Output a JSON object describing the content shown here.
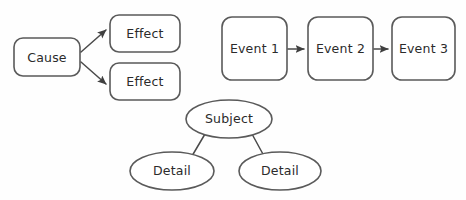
{
  "diagram": {
    "background_color": "#fefefe",
    "stroke_color": "#5a5a5a",
    "connector_color": "#4a4a4a",
    "text_color": "#2b2b2b",
    "groups": [
      {
        "name": "cause-effect-organizer",
        "nodes": [
          {
            "id": "cause",
            "label": "Cause",
            "shape": "rounded-rect",
            "x": 14,
            "y": 38,
            "w": 66,
            "h": 38
          },
          {
            "id": "effect-1",
            "label": "Effect",
            "shape": "rounded-rect",
            "x": 110,
            "y": 15,
            "w": 70,
            "h": 37
          },
          {
            "id": "effect-2",
            "label": "Effect",
            "shape": "rounded-rect",
            "x": 110,
            "y": 63,
            "w": 70,
            "h": 37
          }
        ],
        "connectors": [
          {
            "id": "cause-to-effect-1",
            "from": "cause",
            "to": "effect-1",
            "arrow": true
          },
          {
            "id": "cause-to-effect-2",
            "from": "cause",
            "to": "effect-2",
            "arrow": true
          }
        ]
      },
      {
        "name": "sequence-chain-organizer",
        "nodes": [
          {
            "id": "event-1",
            "label": "Event 1",
            "shape": "rounded-rect",
            "x": 222,
            "y": 17,
            "w": 65,
            "h": 63
          },
          {
            "id": "event-2",
            "label": "Event 2",
            "shape": "rounded-rect",
            "x": 308,
            "y": 17,
            "w": 65,
            "h": 63
          },
          {
            "id": "event-3",
            "label": "Event 3",
            "shape": "rounded-rect",
            "x": 392,
            "y": 17,
            "w": 63,
            "h": 63
          }
        ],
        "connectors": [
          {
            "id": "event-1-to-event-2",
            "from": "event-1",
            "to": "event-2",
            "arrow": true
          },
          {
            "id": "event-2-to-event-3",
            "from": "event-2",
            "to": "event-3",
            "arrow": true
          }
        ]
      },
      {
        "name": "web-cluster-organizer",
        "nodes": [
          {
            "id": "subject",
            "label": "Subject",
            "shape": "ellipse",
            "cx": 229,
            "cy": 119,
            "rx": 43,
            "ry": 19
          },
          {
            "id": "detail-left",
            "label": "Detail",
            "shape": "ellipse",
            "cx": 172,
            "cy": 171,
            "rx": 42,
            "ry": 19
          },
          {
            "id": "detail-right",
            "label": "Detail",
            "shape": "ellipse",
            "cx": 280,
            "cy": 171,
            "rx": 41,
            "ry": 19
          }
        ],
        "connectors": [
          {
            "id": "subject-to-detail-left",
            "from": "subject",
            "to": "detail-left",
            "arrow": false
          },
          {
            "id": "subject-to-detail-right",
            "from": "subject",
            "to": "detail-right",
            "arrow": false
          }
        ]
      }
    ],
    "labels": {
      "cause": "Cause",
      "effect_1": "Effect",
      "effect_2": "Effect",
      "event_1": "Event 1",
      "event_2": "Event 2",
      "event_3": "Event 3",
      "subject": "Subject",
      "detail_left": "Detail",
      "detail_right": "Detail"
    }
  }
}
